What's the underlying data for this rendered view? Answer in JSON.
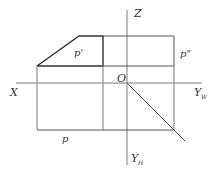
{
  "diagram": {
    "type": "orthographic-projection",
    "labels": {
      "z_axis": "Z",
      "x_axis": "X",
      "yw_axis": "Y",
      "yw_sub": "W",
      "yh_axis": "Y",
      "yh_sub": "H",
      "origin": "O",
      "front_view": "p'",
      "side_view": "p\"",
      "top_view": "p"
    },
    "colors": {
      "thin_line": "#7a7a7a",
      "thick_line": "#333333",
      "text": "#333333"
    }
  }
}
